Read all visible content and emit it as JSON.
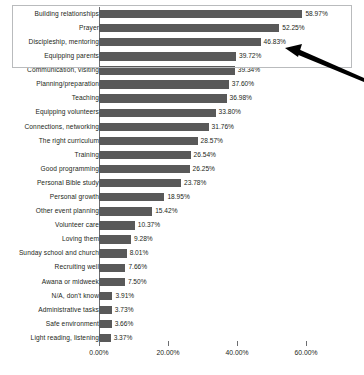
{
  "chart_data": {
    "type": "bar",
    "orientation": "horizontal",
    "title": "",
    "subtitle": "",
    "xlabel": "",
    "ylabel": "",
    "xlim": [
      0,
      60
    ],
    "grid": false,
    "legend": null,
    "bar_color": "#595959",
    "axis_color": "#6d6e71",
    "value_suffix": "%",
    "tick_labels": [
      "0.00%",
      "20.00%",
      "40.00%",
      "60.00%"
    ],
    "tick_values": [
      0,
      20,
      40,
      60
    ],
    "categories": [
      "Building relationships",
      "Prayer",
      "Discipleship, mentoring",
      "Equipping parents",
      "Communication, visiting",
      "Planning/preparation",
      "Teaching",
      "Equipping volunteers",
      "Connections, networking",
      "The right curriculum",
      "Training",
      "Good programming",
      "Personal Bible study",
      "Personal growth",
      "Other event planning",
      "Volunteer care",
      "Loving them",
      "Sunday school and church",
      "Recruiting well",
      "Awana or midweek",
      "N/A, don't know",
      "Administrative tasks",
      "Safe environment",
      "Light reading, listening"
    ],
    "values": [
      58.97,
      52.25,
      46.83,
      39.72,
      39.34,
      37.6,
      36.98,
      33.8,
      31.76,
      28.57,
      26.54,
      26.25,
      23.78,
      18.95,
      15.42,
      10.37,
      9.28,
      8.01,
      7.66,
      7.5,
      3.91,
      3.73,
      3.66,
      3.37
    ],
    "data_labels": [
      "58.97%",
      "52.25%",
      "46.83%",
      "39.72%",
      "39.34%",
      "37.60%",
      "36.98%",
      "33.80%",
      "31.76%",
      "28.57%",
      "26.54%",
      "26.25%",
      "23.78%",
      "18.95%",
      "15.42%",
      "10.37%",
      "9.28%",
      "8.01%",
      "7.66%",
      "7.50%",
      "3.91%",
      "3.73%",
      "3.66%",
      "3.37%"
    ],
    "annotations": [
      {
        "kind": "highlight-box",
        "covers_categories": [
          "Building relationships",
          "Prayer",
          "Discipleship, mentoring",
          "Equipping parents"
        ],
        "color": "#b9bbbd"
      },
      {
        "kind": "arrow",
        "points_to_category": "Discipleship, mentoring",
        "points_to_label": "46.83%",
        "color": "#000000"
      }
    ]
  }
}
